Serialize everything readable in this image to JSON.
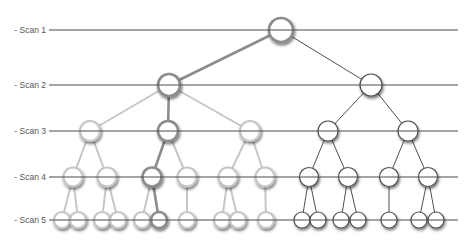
{
  "diagram": {
    "type": "tree-scan-levels",
    "colors": {
      "scan_line": "#4a4a4a",
      "label": "#555555",
      "highlight": "#8c8c8c",
      "faded": "#c6c6c6",
      "dark": "#505050",
      "node_fill": "#ffffff"
    },
    "scan_line_x": [
      49,
      458
    ],
    "scans": [
      {
        "label": "- Scan 1",
        "y": 30
      },
      {
        "label": "- Scan 2",
        "y": 85
      },
      {
        "label": "- Scan 3",
        "y": 131
      },
      {
        "label": "- Scan 4",
        "y": 177
      },
      {
        "label": "- Scan 5",
        "y": 220
      }
    ],
    "nodes": [
      {
        "id": "r",
        "x": 281,
        "y": 30,
        "r": 12,
        "style": "highlight"
      },
      {
        "id": "L",
        "x": 169,
        "y": 85,
        "r": 11,
        "style": "highlight"
      },
      {
        "id": "R",
        "x": 371,
        "y": 85,
        "r": 11,
        "style": "dark"
      },
      {
        "id": "L1",
        "x": 90,
        "y": 131,
        "r": 10,
        "style": "faded"
      },
      {
        "id": "L2",
        "x": 168,
        "y": 131,
        "r": 10,
        "style": "highlight"
      },
      {
        "id": "L3",
        "x": 250,
        "y": 131,
        "r": 10,
        "style": "faded"
      },
      {
        "id": "R1",
        "x": 328,
        "y": 131,
        "r": 10,
        "style": "dark"
      },
      {
        "id": "R2",
        "x": 408,
        "y": 131,
        "r": 10,
        "style": "dark"
      },
      {
        "id": "L1a",
        "x": 73,
        "y": 177,
        "r": 9.5,
        "style": "faded"
      },
      {
        "id": "L1b",
        "x": 107,
        "y": 177,
        "r": 9.5,
        "style": "faded"
      },
      {
        "id": "L2a",
        "x": 152,
        "y": 177,
        "r": 9.5,
        "style": "highlight"
      },
      {
        "id": "L2b",
        "x": 187,
        "y": 177,
        "r": 9.5,
        "style": "faded"
      },
      {
        "id": "L3a",
        "x": 228,
        "y": 177,
        "r": 9.5,
        "style": "faded"
      },
      {
        "id": "L3b",
        "x": 265,
        "y": 177,
        "r": 9.5,
        "style": "faded"
      },
      {
        "id": "R1a",
        "x": 309,
        "y": 177,
        "r": 9.5,
        "style": "dark"
      },
      {
        "id": "R1b",
        "x": 348,
        "y": 177,
        "r": 9.5,
        "style": "dark"
      },
      {
        "id": "R2a",
        "x": 389,
        "y": 177,
        "r": 9.5,
        "style": "dark"
      },
      {
        "id": "R2b",
        "x": 428,
        "y": 177,
        "r": 9.5,
        "style": "dark"
      },
      {
        "id": "s1",
        "x": 62,
        "y": 220,
        "r": 8,
        "style": "faded"
      },
      {
        "id": "s2",
        "x": 78,
        "y": 220,
        "r": 8,
        "style": "faded"
      },
      {
        "id": "s3",
        "x": 102,
        "y": 220,
        "r": 8,
        "style": "faded"
      },
      {
        "id": "s4",
        "x": 118,
        "y": 220,
        "r": 8,
        "style": "faded"
      },
      {
        "id": "s5",
        "x": 142,
        "y": 220,
        "r": 8,
        "style": "faded"
      },
      {
        "id": "s6",
        "x": 159,
        "y": 220,
        "r": 8,
        "style": "highlight"
      },
      {
        "id": "s7",
        "x": 187,
        "y": 220,
        "r": 8,
        "style": "faded"
      },
      {
        "id": "s8",
        "x": 222,
        "y": 220,
        "r": 8,
        "style": "faded"
      },
      {
        "id": "s9",
        "x": 238,
        "y": 220,
        "r": 8,
        "style": "faded"
      },
      {
        "id": "s10",
        "x": 266,
        "y": 220,
        "r": 8,
        "style": "faded"
      },
      {
        "id": "s11",
        "x": 302,
        "y": 220,
        "r": 8,
        "style": "dark"
      },
      {
        "id": "s12",
        "x": 318,
        "y": 220,
        "r": 8,
        "style": "dark"
      },
      {
        "id": "s13",
        "x": 341,
        "y": 220,
        "r": 8,
        "style": "dark"
      },
      {
        "id": "s14",
        "x": 358,
        "y": 220,
        "r": 8,
        "style": "dark"
      },
      {
        "id": "s15",
        "x": 389,
        "y": 220,
        "r": 8,
        "style": "dark"
      },
      {
        "id": "s16",
        "x": 419,
        "y": 220,
        "r": 8,
        "style": "dark"
      },
      {
        "id": "s17",
        "x": 436,
        "y": 220,
        "r": 8,
        "style": "dark"
      }
    ],
    "edges": [
      [
        "r",
        "L",
        "highlight"
      ],
      [
        "r",
        "R",
        "dark"
      ],
      [
        "L",
        "L1",
        "faded"
      ],
      [
        "L",
        "L2",
        "highlight"
      ],
      [
        "L",
        "L3",
        "faded"
      ],
      [
        "R",
        "R1",
        "dark"
      ],
      [
        "R",
        "R2",
        "dark"
      ],
      [
        "L1",
        "L1a",
        "faded"
      ],
      [
        "L1",
        "L1b",
        "faded"
      ],
      [
        "L2",
        "L2a",
        "highlight"
      ],
      [
        "L2",
        "L2b",
        "faded"
      ],
      [
        "L3",
        "L3a",
        "faded"
      ],
      [
        "L3",
        "L3b",
        "faded"
      ],
      [
        "R1",
        "R1a",
        "dark"
      ],
      [
        "R1",
        "R1b",
        "dark"
      ],
      [
        "R2",
        "R2a",
        "dark"
      ],
      [
        "R2",
        "R2b",
        "dark"
      ],
      [
        "L1a",
        "s1",
        "faded"
      ],
      [
        "L1a",
        "s2",
        "faded"
      ],
      [
        "L1b",
        "s3",
        "faded"
      ],
      [
        "L1b",
        "s4",
        "faded"
      ],
      [
        "L2a",
        "s5",
        "faded"
      ],
      [
        "L2a",
        "s6",
        "highlight"
      ],
      [
        "L2b",
        "s7",
        "faded"
      ],
      [
        "L3a",
        "s8",
        "faded"
      ],
      [
        "L3a",
        "s9",
        "faded"
      ],
      [
        "L3b",
        "s10",
        "faded"
      ],
      [
        "R1a",
        "s11",
        "dark"
      ],
      [
        "R1a",
        "s12",
        "dark"
      ],
      [
        "R1b",
        "s13",
        "dark"
      ],
      [
        "R1b",
        "s14",
        "dark"
      ],
      [
        "R2a",
        "s15",
        "dark"
      ],
      [
        "R2b",
        "s16",
        "dark"
      ],
      [
        "R2b",
        "s17",
        "dark"
      ]
    ]
  }
}
